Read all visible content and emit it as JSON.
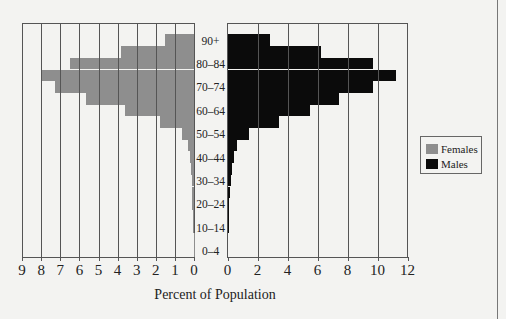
{
  "chart_data": {
    "type": "bar",
    "subtype": "population-pyramid",
    "title": "",
    "xlabel": "Percent of Population",
    "ylabel": "",
    "categories": [
      "0-4",
      "5-9",
      "10-14",
      "15-19",
      "20-24",
      "25-29",
      "30-34",
      "35-39",
      "40-44",
      "45-49",
      "50-54",
      "55-59",
      "60-64",
      "65-69",
      "70-74",
      "75-79",
      "80-84",
      "85-89",
      "90+"
    ],
    "age_tick_labels": [
      "0–4",
      "10–14",
      "20–24",
      "30–34",
      "40–44",
      "50–54",
      "60–64",
      "70–74",
      "80–84",
      "90+"
    ],
    "series": [
      {
        "name": "Females",
        "color": "#8e8e8e",
        "side": "left",
        "values": [
          0.02,
          0.02,
          0.03,
          0.05,
          0.08,
          0.1,
          0.12,
          0.15,
          0.2,
          0.3,
          0.65,
          1.8,
          3.6,
          5.65,
          7.3,
          8.0,
          6.5,
          3.8,
          1.5
        ]
      },
      {
        "name": "Males",
        "color": "#0b0b0b",
        "side": "right",
        "values": [
          0.0,
          0.0,
          0.02,
          0.05,
          0.1,
          0.15,
          0.2,
          0.3,
          0.45,
          0.65,
          1.4,
          3.4,
          5.5,
          7.4,
          9.7,
          11.2,
          9.7,
          6.25,
          2.8
        ]
      }
    ],
    "left_axis": {
      "range": [
        9,
        0
      ],
      "ticks": [
        "9",
        "8",
        "7",
        "6",
        "5",
        "4",
        "3",
        "2",
        "1",
        "0"
      ]
    },
    "right_axis": {
      "range": [
        0,
        12
      ],
      "ticks": [
        "0",
        "2",
        "4",
        "6",
        "8",
        "10",
        "12"
      ]
    },
    "grid": true,
    "legend_position": "right"
  },
  "legend": {
    "females": "Females",
    "males": "Males"
  },
  "xlabel": "Percent of Population"
}
